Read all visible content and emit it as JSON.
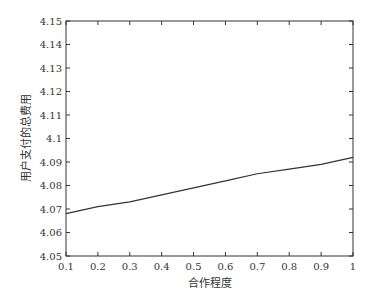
{
  "chart_data": {
    "type": "line",
    "title": "",
    "xlabel": "合作程度",
    "ylabel": "用户支付的总费用",
    "xlim": [
      0.1,
      1
    ],
    "ylim": [
      4.05,
      4.15
    ],
    "grid": false,
    "legend": null,
    "x_ticks": [
      "0.1",
      "0.2",
      "0.3",
      "0.4",
      "0.5",
      "0.6",
      "0.7",
      "0.8",
      "0.9",
      "1"
    ],
    "y_ticks": [
      "4.05",
      "4.06",
      "4.07",
      "4.08",
      "4.09",
      "4.1",
      "4.11",
      "4.12",
      "4.13",
      "4.14",
      "4.15"
    ],
    "series": [
      {
        "name": "总费用",
        "x": [
          0.1,
          0.2,
          0.3,
          0.4,
          0.5,
          0.6,
          0.7,
          0.8,
          0.9,
          1.0
        ],
        "values": [
          4.068,
          4.071,
          4.073,
          4.076,
          4.079,
          4.082,
          4.085,
          4.087,
          4.089,
          4.092
        ],
        "color": "#333333"
      }
    ]
  }
}
